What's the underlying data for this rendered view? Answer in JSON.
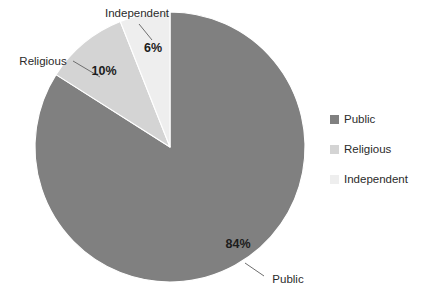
{
  "chart_data": {
    "type": "pie",
    "title": "",
    "categories": [
      "Public",
      "Religious",
      "Independent"
    ],
    "values": [
      84,
      10,
      6
    ],
    "value_labels": [
      "84%",
      "10%",
      "6%"
    ],
    "colors": [
      "#808080",
      "#d4d4d4",
      "#eeeeee"
    ],
    "legend_position": "right",
    "grid": false,
    "start_angle_deg": 0,
    "direction": "clockwise",
    "callouts": [
      {
        "label": "Public",
        "value_label": "84%"
      },
      {
        "label": "Religious",
        "value_label": "10%"
      },
      {
        "label": "Independent",
        "value_label": "6%"
      }
    ]
  },
  "legend": {
    "items": [
      {
        "label": "Public",
        "color": "#808080"
      },
      {
        "label": "Religious",
        "color": "#d4d4d4"
      },
      {
        "label": "Independent",
        "color": "#eeeeee"
      }
    ]
  },
  "labels": {
    "public_value": "84%",
    "religious_value": "10%",
    "independent_value": "6%",
    "public_callout": "Public",
    "religious_callout": "Religious",
    "independent_callout": "Independent"
  }
}
